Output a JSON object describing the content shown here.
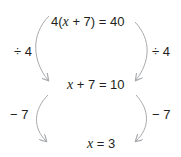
{
  "diagram": {
    "steps": [
      {
        "before": "4(",
        "var": "x",
        "after": " + 7) = 40"
      },
      {
        "before": "",
        "var": "x",
        "after": " + 7 = 10"
      },
      {
        "before": "",
        "var": "x",
        "after": " = 3"
      }
    ],
    "operations": [
      {
        "left": "÷ 4",
        "right": "÷ 4"
      },
      {
        "left": "− 7",
        "right": "− 7"
      }
    ],
    "arrow_color": "#a7a9ac",
    "text_color": "#231f20"
  }
}
